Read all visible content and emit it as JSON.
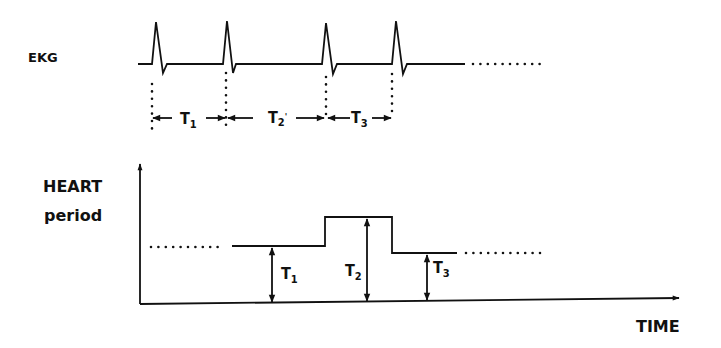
{
  "ekg": {
    "label": "EKG",
    "beats_x": [
      156,
      227,
      326,
      396
    ],
    "intervals": [
      {
        "label": "T",
        "sub": "1",
        "from": 156,
        "to": 227
      },
      {
        "label": "T",
        "sub": "2",
        "prime": "'",
        "from": 227,
        "to": 326
      },
      {
        "label": "T",
        "sub": "3",
        "from": 326,
        "to": 396
      }
    ]
  },
  "graph": {
    "ylabel_line1": "HEART",
    "ylabel_line2": "period",
    "xlabel": "TIME",
    "levels": [
      {
        "label": "T",
        "sub": "1",
        "value": "T1"
      },
      {
        "label": "T",
        "sub": "2",
        "value": "T2"
      },
      {
        "label": "T",
        "sub": "3",
        "value": "T3"
      }
    ]
  },
  "colors": {
    "ink": "#111111",
    "background": "#ffffff"
  }
}
